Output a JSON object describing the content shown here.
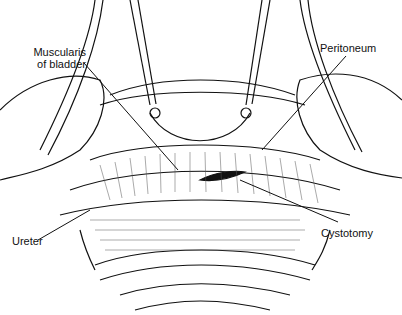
{
  "figure": {
    "labels": [
      {
        "id": "muscularis",
        "text_line1": "Muscularis",
        "text_line2": "of bladder"
      },
      {
        "id": "peritoneum",
        "text": "Peritoneum"
      },
      {
        "id": "ureter",
        "text": "Ureter"
      },
      {
        "id": "cystotomy",
        "text": "Cystotomy"
      }
    ]
  }
}
